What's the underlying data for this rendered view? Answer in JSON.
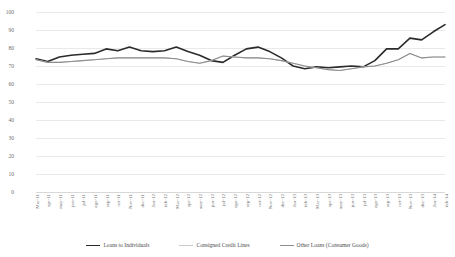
{
  "chart_data": {
    "type": "line",
    "title": "",
    "xlabel": "",
    "ylabel": "",
    "ylim": [
      0,
      100
    ],
    "ytick_step": 10,
    "yticks": [
      0,
      10,
      20,
      30,
      40,
      50,
      60,
      70,
      80,
      90,
      100
    ],
    "grid": true,
    "legend_position": "bottom",
    "categories": [
      "Mar-11",
      "apr-11",
      "may-11",
      "jun-11",
      "jul-11",
      "ago-11",
      "sep-11",
      "oct-11",
      "Nov-11",
      "dec-11",
      "Jan-12",
      "feb-12",
      "Mar-12",
      "apr-12",
      "may-12",
      "jun-12",
      "jul-12",
      "ago-12",
      "sep-12",
      "oct-12",
      "Nov-12",
      "dec-12",
      "Jan-13",
      "feb-13",
      "Mar-13",
      "apr-13",
      "may-13",
      "jun-13",
      "jul-13",
      "ago-13",
      "sep-13",
      "oct-13",
      "Nov-13",
      "dec-13",
      "Jan-14",
      "feb-14"
    ],
    "series": [
      {
        "name": "Loans to Individuals",
        "color": "#2b2b2b",
        "width": 1.6,
        "values": [
          74.0,
          72.5,
          75.0,
          76.0,
          76.5,
          77.0,
          79.5,
          78.5,
          80.5,
          78.5,
          78.0,
          78.5,
          80.5,
          78.0,
          76.0,
          73.0,
          72.0,
          76.0,
          79.5,
          80.5,
          78.0,
          74.5,
          70.0,
          68.5,
          69.5,
          69.0,
          69.5,
          70.0,
          69.5,
          73.0,
          79.5,
          79.5,
          85.5,
          84.5,
          89.0,
          93.0
        ]
      },
      {
        "name": "Consigned Credit Lines",
        "color": "#c9c9c9",
        "width": 1.0,
        "values": [
          73.5,
          72.0,
          72.0,
          72.5,
          73.0,
          73.5,
          74.0,
          74.5,
          74.5,
          74.5,
          74.5,
          74.5,
          74.0,
          72.5,
          71.5,
          73.0,
          75.5,
          75.0,
          74.5,
          74.5,
          74.0,
          73.0,
          71.5,
          70.0,
          69.0,
          68.0,
          67.5,
          68.5,
          69.5,
          70.0,
          71.5,
          73.5,
          77.0,
          74.5,
          75.0,
          75.0
        ]
      },
      {
        "name": "Other Loans (Consumer Goods)",
        "color": "#8d8d8d",
        "width": 1.1,
        "values": [
          73.5,
          72.0,
          72.0,
          72.5,
          73.0,
          73.5,
          74.0,
          74.5,
          74.5,
          74.5,
          74.5,
          74.5,
          74.0,
          72.5,
          71.5,
          73.0,
          75.5,
          75.0,
          74.5,
          74.5,
          74.0,
          73.0,
          71.5,
          70.0,
          69.0,
          68.0,
          67.5,
          68.5,
          69.5,
          70.0,
          71.5,
          73.5,
          77.0,
          74.5,
          75.0,
          75.0
        ]
      }
    ]
  },
  "legend": {
    "items": [
      {
        "label": "Loans to Individuals"
      },
      {
        "label": "Consigned Credit Lines"
      },
      {
        "label": "Other Loans (Consumer Goods)"
      }
    ]
  }
}
